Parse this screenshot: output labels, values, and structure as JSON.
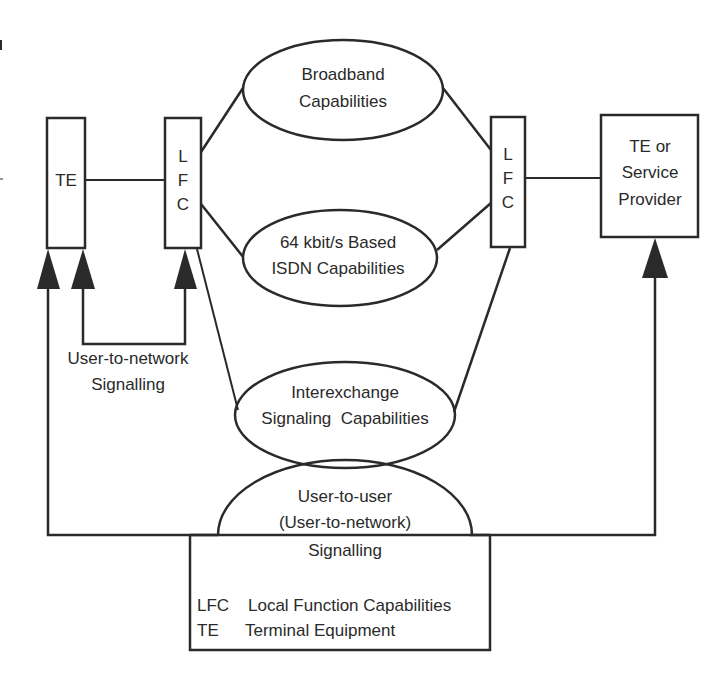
{
  "diagram": {
    "nodes": {
      "te_left": {
        "label": "TE"
      },
      "lfc_left": {
        "lines": [
          "L",
          "F",
          "C"
        ]
      },
      "broadband": {
        "lines": [
          "Broadband",
          "Capabilities"
        ]
      },
      "isdn64": {
        "lines": [
          "64 kbit/s Based",
          "ISDN Capabilities"
        ]
      },
      "lfc_right": {
        "lines": [
          "L",
          "F",
          "C"
        ]
      },
      "te_service_provider": {
        "lines": [
          "TE or",
          "Service",
          "Provider"
        ]
      },
      "interexchange": {
        "lines": [
          "Interexchange",
          "Signaling  Capabilities"
        ]
      },
      "user_to_user": {
        "lines": [
          "User-to-user",
          "(User-to-network)",
          "Signalling"
        ]
      }
    },
    "labels": {
      "user_to_network": [
        "User-to-network",
        "Signalling"
      ]
    },
    "legend": {
      "items": [
        {
          "abbr": "LFC",
          "meaning": "Local Function Capabilities"
        },
        {
          "abbr": "TE",
          "meaning": "Terminal Equipment"
        }
      ]
    },
    "colors": {
      "line": "#2a2a2a",
      "background": "#ffffff"
    }
  }
}
